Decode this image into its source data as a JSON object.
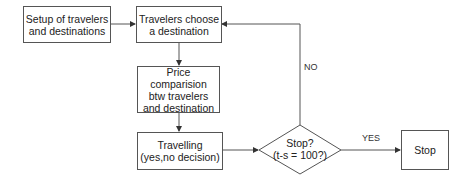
{
  "diagram": {
    "nodes": {
      "setup": {
        "label": "Setup of travelers and destinations",
        "line1": "Setup of travelers",
        "line2": "and destinations"
      },
      "choose": {
        "label": "Travelers choose a destination",
        "line1": "Travelers choose",
        "line2": "a destination"
      },
      "price": {
        "label": "Price comparision btw travelers and destination",
        "line1": "Price comparision",
        "line2": "btw travelers",
        "line3": "and destination"
      },
      "travel": {
        "label": "Travelling (yes,no decision)",
        "line1": "Travelling",
        "line2": "(yes,no decision)"
      },
      "decision": {
        "label": "Stop? (t-s = 100?)",
        "line1": "Stop?",
        "line2": "(t-s = 100?)"
      },
      "stop": {
        "label": "Stop"
      }
    },
    "edges": [
      {
        "from": "setup",
        "to": "choose",
        "label": ""
      },
      {
        "from": "choose",
        "to": "price",
        "label": ""
      },
      {
        "from": "price",
        "to": "travel",
        "label": ""
      },
      {
        "from": "travel",
        "to": "decision",
        "label": ""
      },
      {
        "from": "decision",
        "to": "stop",
        "label": "YES"
      },
      {
        "from": "decision",
        "to": "choose",
        "label": "NO"
      }
    ],
    "edge_labels": {
      "yes": "YES",
      "no": "NO"
    },
    "colors": {
      "line": "#555555",
      "background": "#ffffff",
      "text": "#222222"
    }
  }
}
